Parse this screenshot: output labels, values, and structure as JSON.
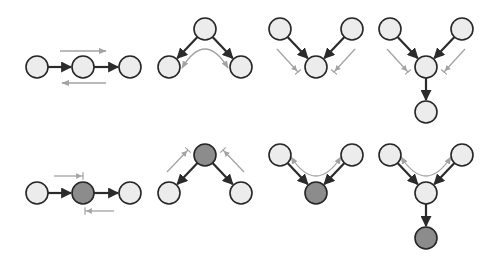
{
  "colors": {
    "background": "#ffffff",
    "node_unobserved": "#ececec",
    "node_observed": "#8c8c8c",
    "node_stroke": "#262626",
    "edge": "#2b2b2b",
    "flow_arrow": "#a3a3a3"
  },
  "node_radius": 11,
  "diagrams": [
    {
      "id": "chain-unobserved",
      "row": 1,
      "nodes": [
        {
          "x": 37,
          "y": 67,
          "observed": false
        },
        {
          "x": 83,
          "y": 67,
          "observed": false
        },
        {
          "x": 130,
          "y": 67,
          "observed": false
        }
      ],
      "edges": [
        [
          0,
          1
        ],
        [
          1,
          2
        ]
      ],
      "flows": [
        {
          "path": "M60,51 L106,51",
          "end": "arrow"
        },
        {
          "path": "M106,83 L62,83",
          "end": "arrow"
        }
      ]
    },
    {
      "id": "fork-unobserved",
      "row": 1,
      "nodes": [
        {
          "x": 205,
          "y": 29,
          "observed": false
        },
        {
          "x": 169,
          "y": 67,
          "observed": false
        },
        {
          "x": 241,
          "y": 67,
          "observed": false
        }
      ],
      "edges": [
        [
          0,
          1
        ],
        [
          0,
          2
        ]
      ],
      "flows": [
        {
          "path": "M182,68 Q205,30 228,68",
          "end": "arrow-both"
        }
      ]
    },
    {
      "id": "collider-unobserved",
      "row": 1,
      "nodes": [
        {
          "x": 280,
          "y": 29,
          "observed": false
        },
        {
          "x": 352,
          "y": 29,
          "observed": false
        },
        {
          "x": 316,
          "y": 67,
          "observed": false
        }
      ],
      "edges": [
        [
          0,
          2
        ],
        [
          1,
          2
        ]
      ],
      "flows": [
        {
          "path": "M277,49 L298,72",
          "end": "blocked"
        },
        {
          "path": "M355,49 L334,72",
          "end": "blocked"
        }
      ]
    },
    {
      "id": "collider-descendant-unobserved",
      "row": 1,
      "nodes": [
        {
          "x": 390,
          "y": 29,
          "observed": false
        },
        {
          "x": 462,
          "y": 29,
          "observed": false
        },
        {
          "x": 426,
          "y": 67,
          "observed": false
        },
        {
          "x": 426,
          "y": 112,
          "observed": false
        }
      ],
      "edges": [
        [
          0,
          2
        ],
        [
          1,
          2
        ],
        [
          2,
          3
        ]
      ],
      "flows": [
        {
          "path": "M387,49 L408,72",
          "end": "blocked"
        },
        {
          "path": "M465,49 L444,72",
          "end": "blocked"
        }
      ]
    },
    {
      "id": "chain-observed",
      "row": 2,
      "nodes": [
        {
          "x": 37,
          "y": 193,
          "observed": false
        },
        {
          "x": 83,
          "y": 193,
          "observed": true
        },
        {
          "x": 130,
          "y": 193,
          "observed": false
        }
      ],
      "edges": [
        [
          0,
          1
        ],
        [
          1,
          2
        ]
      ],
      "flows": [
        {
          "path": "M54,176 L83,176",
          "end": "blocked"
        },
        {
          "path": "M114,211 L85,211",
          "end": "blocked"
        }
      ]
    },
    {
      "id": "fork-observed",
      "row": 2,
      "nodes": [
        {
          "x": 205,
          "y": 155,
          "observed": true
        },
        {
          "x": 169,
          "y": 193,
          "observed": false
        },
        {
          "x": 241,
          "y": 193,
          "observed": false
        }
      ],
      "edges": [
        [
          0,
          1
        ],
        [
          0,
          2
        ]
      ],
      "flows": [
        {
          "path": "M167,172 L188,150",
          "end": "blocked"
        },
        {
          "path": "M244,172 L223,150",
          "end": "blocked"
        }
      ]
    },
    {
      "id": "collider-observed",
      "row": 2,
      "nodes": [
        {
          "x": 280,
          "y": 155,
          "observed": false
        },
        {
          "x": 352,
          "y": 155,
          "observed": false
        },
        {
          "x": 316,
          "y": 193,
          "observed": true
        }
      ],
      "edges": [
        [
          0,
          2
        ],
        [
          1,
          2
        ]
      ],
      "flows": [
        {
          "path": "M291,157 Q316,195 341,157",
          "end": "arrow-both"
        }
      ]
    },
    {
      "id": "collider-descendant-observed",
      "row": 2,
      "nodes": [
        {
          "x": 390,
          "y": 155,
          "observed": false
        },
        {
          "x": 462,
          "y": 155,
          "observed": false
        },
        {
          "x": 426,
          "y": 193,
          "observed": false
        },
        {
          "x": 426,
          "y": 238,
          "observed": true
        }
      ],
      "edges": [
        [
          0,
          2
        ],
        [
          1,
          2
        ],
        [
          2,
          3
        ]
      ],
      "flows": [
        {
          "path": "M401,157 Q426,195 451,157",
          "end": "arrow-both"
        }
      ]
    }
  ]
}
